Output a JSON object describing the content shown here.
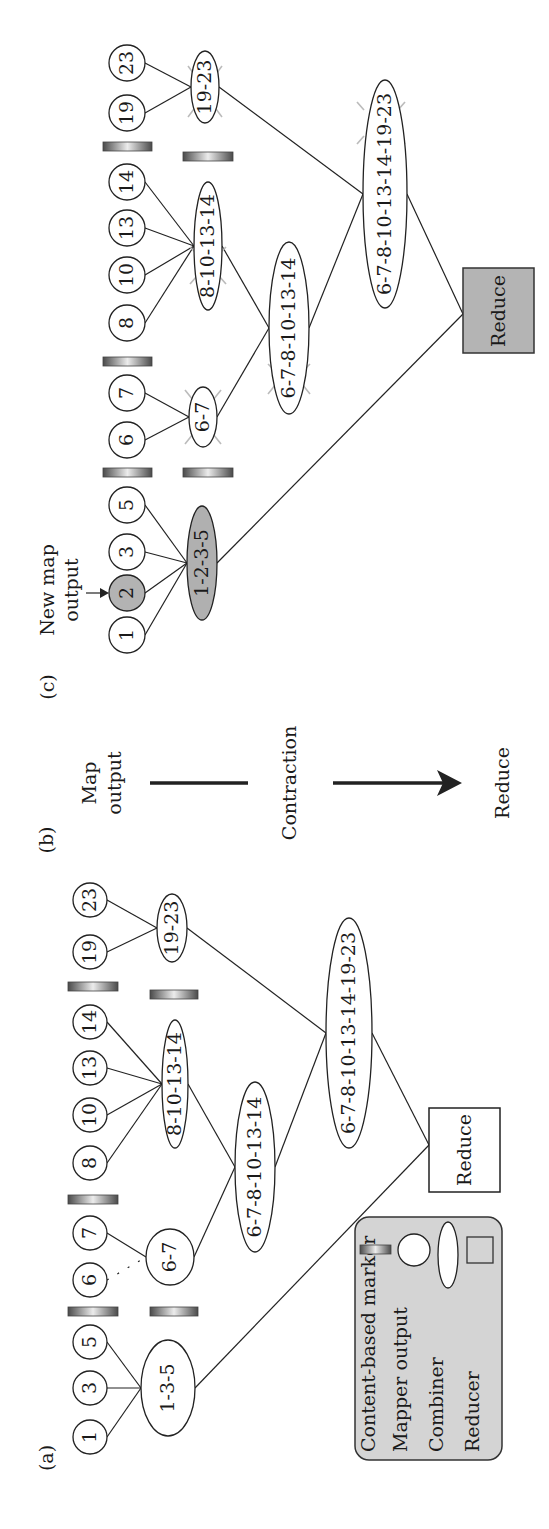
{
  "figure": {
    "orientation": "rotated 90 degrees counter-clockwise on page",
    "colors": {
      "mapper_fill": "#ffffff",
      "new_output_fill": "#b3b3b3",
      "reducer_active_fill": "#b4b4b4",
      "legend_fill": "#d4d4d4",
      "marker_dark": "#555555",
      "marker_light": "#e8e8e8"
    }
  },
  "panel_a": {
    "label": "(a)",
    "mapper_outputs": [
      "1",
      "3",
      "5",
      "6",
      "7",
      "8",
      "10",
      "13",
      "14",
      "19",
      "23"
    ],
    "combiners": {
      "c1": "1-3-5",
      "c2": "6-7",
      "c3": "8-10-13-14",
      "c4": "19-23",
      "c5": "6-7-8-10-13-14",
      "c6": "6-7-8-10-13-14-19-23"
    },
    "reducer": "Reduce"
  },
  "panel_b": {
    "label": "(b)",
    "map_output_line1": "Map",
    "map_output_line2": "output",
    "contraction": "Contraction",
    "reduce": "Reduce"
  },
  "panel_c": {
    "label": "(c)",
    "annotation_line1": "New map",
    "annotation_line2": "output",
    "mapper_outputs": [
      "1",
      "2",
      "3",
      "5",
      "6",
      "7",
      "8",
      "10",
      "13",
      "14",
      "19",
      "23"
    ],
    "new_output": "2",
    "combiners": {
      "c1": "1-2-3-5",
      "c2": "6-7",
      "c3": "8-10-13-14",
      "c4": "19-23",
      "c5": "6-7-8-10-13-14",
      "c6": "6-7-8-10-13-14-19-23"
    },
    "reducer": "Reduce"
  },
  "legend": {
    "items": [
      {
        "label": "Content-based marker",
        "icon": "gradient-bar"
      },
      {
        "label": "Mapper output",
        "icon": "circle"
      },
      {
        "label": "Combiner",
        "icon": "ellipse"
      },
      {
        "label": "Reducer",
        "icon": "square"
      }
    ]
  }
}
